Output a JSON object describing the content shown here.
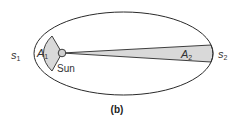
{
  "figure": {
    "caption": "(b)",
    "colors": {
      "orbit_stroke": "#2a2a2a",
      "sector_fill": "#d9d9d9",
      "sun_fill": "#cfcfcf",
      "text": "#333333"
    },
    "labels": {
      "s1_main": "s",
      "s1_sub": "1",
      "a1_main": "A",
      "a1_sub": "1",
      "sun": "Sun",
      "a2_main": "A",
      "a2_sub": "2",
      "s2_main": "s",
      "s2_sub": "2"
    }
  }
}
